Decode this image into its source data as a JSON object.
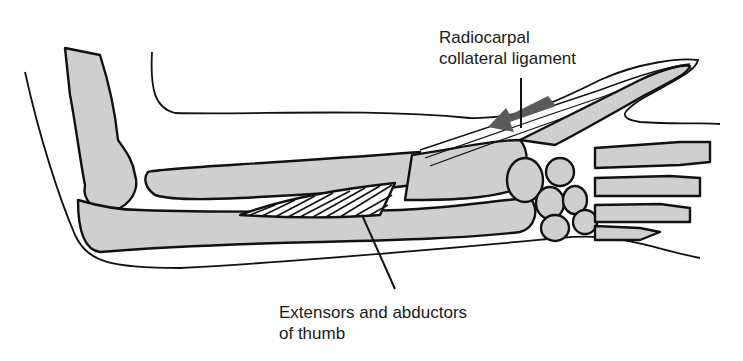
{
  "figure": {
    "labels": {
      "ligament": {
        "line1": "Radiocarpal",
        "line2": "collateral ligament"
      },
      "extensors": {
        "line1": "Extensors and abductors",
        "line2": "of thumb"
      }
    },
    "arrow": {
      "direction": "left-down",
      "color": "#5a5a5a"
    },
    "colors": {
      "bone_fill": "#cfcfcf",
      "outline": "#111111",
      "background": "#ffffff"
    }
  }
}
